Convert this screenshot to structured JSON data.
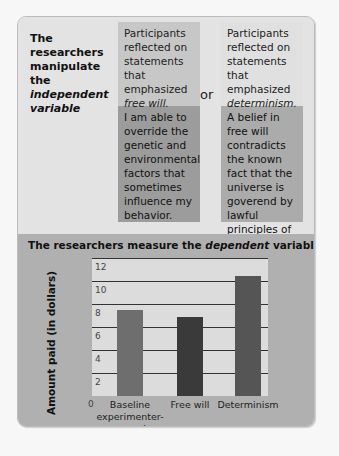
{
  "manipulate": {
    "label_prefix": "The researchers manipulate the",
    "label_italic": "independent variable",
    "connector": "or",
    "conditions": [
      {
        "description_prefix": "Participants reflected on statements that emphasized",
        "description_italic": "free will.",
        "example": "I am able to override the genetic and environmental factors that sometimes influence my behavior."
      },
      {
        "description_prefix": "Participants reflected on statements that emphasized",
        "description_italic": "determinism.",
        "example": "A belief in free will contradicts the known fact that the universe is goverend by lawful principles of science."
      }
    ]
  },
  "measure": {
    "title_prefix": "The researchers measure the",
    "title_italic": "dependent",
    "title_suffix": "variable"
  },
  "colors": {
    "baseline_bar": "#6e6e6e",
    "free_will_bar": "#3a3a3a",
    "determinism_bar": "#555555",
    "plot_bg": "#dcdcdc",
    "panel_bottom": "#b0b0b0"
  },
  "chart_data": {
    "type": "bar",
    "title": "The researchers measure the dependent variable",
    "xlabel": "",
    "ylabel": "Amount paid (in dollars)",
    "categories": [
      "Baseline experimenter-scored",
      "Free will",
      "Determinism"
    ],
    "values": [
      7.5,
      6.9,
      10.4
    ],
    "yticks": [
      0,
      2,
      4,
      6,
      8,
      10,
      12
    ],
    "ylim": [
      0,
      12
    ],
    "grid": true,
    "legend": null
  }
}
